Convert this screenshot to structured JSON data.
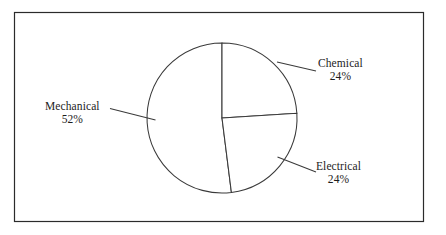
{
  "figure": {
    "background_color": "#ffffff",
    "border_color": "#2b2b2b",
    "line_color": "#3a3a3a",
    "text_color": "#1c1c1c"
  },
  "chart_data": {
    "type": "pie",
    "title": "",
    "subtitle": "",
    "xlabel": "",
    "ylabel": "",
    "legend_position": "none",
    "grid": false,
    "labels_outside": true,
    "start_angle_deg": 0,
    "direction": "clockwise",
    "categories": [
      "Chemical",
      "Electrical",
      "Mechanical"
    ],
    "values": [
      24,
      24,
      52
    ],
    "value_unit": "%",
    "slices": [
      {
        "name": "Chemical",
        "value": 24,
        "value_label": "24%",
        "start_deg": 0.0,
        "end_deg": 86.4,
        "fill": "#ffffff"
      },
      {
        "name": "Electrical",
        "value": 24,
        "value_label": "24%",
        "start_deg": 86.4,
        "end_deg": 172.8,
        "fill": "#ffffff"
      },
      {
        "name": "Mechanical",
        "value": 52,
        "value_label": "52%",
        "start_deg": 172.8,
        "end_deg": 360.0,
        "fill": "#ffffff"
      }
    ],
    "annotations": [
      {
        "name": "Chemical",
        "value_label": "24%"
      },
      {
        "name": "Mechanical",
        "value_label": "52%"
      },
      {
        "name": "Electrical",
        "value_label": "24%"
      }
    ]
  },
  "labels": {
    "chemical": {
      "name": "Chemical",
      "value": "24%"
    },
    "mechanical": {
      "name": "Mechanical",
      "value": "52%"
    },
    "electrical": {
      "name": "Electrical",
      "value": "24%"
    }
  }
}
